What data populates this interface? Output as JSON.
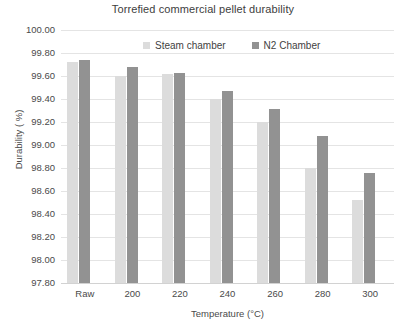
{
  "chart_data": {
    "type": "bar",
    "title": "Torrefied commercial pellet durability",
    "xlabel": "Temperature (°C)",
    "ylabel": "Durability ( %)",
    "categories": [
      "Raw",
      "200",
      "220",
      "240",
      "260",
      "280",
      "300"
    ],
    "ylim": [
      97.8,
      100.0
    ],
    "ytick_step": 0.2,
    "ytick_labels": [
      "100.00",
      "99.80",
      "99.60",
      "99.40",
      "99.20",
      "99.00",
      "98.80",
      "98.60",
      "98.40",
      "98.20",
      "98.00",
      "97.80"
    ],
    "grid": true,
    "legend_position": "top-center",
    "series": [
      {
        "name": "Steam chamber",
        "color": "#dcdcdc",
        "values": [
          99.72,
          99.6,
          99.62,
          99.4,
          99.2,
          98.8,
          98.52
        ]
      },
      {
        "name": "N2 Chamber",
        "color": "#929292",
        "values": [
          99.74,
          99.68,
          99.63,
          99.47,
          99.31,
          99.08,
          98.76
        ]
      }
    ]
  }
}
